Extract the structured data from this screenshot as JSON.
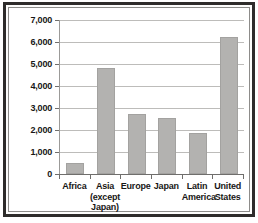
{
  "chart_data": {
    "type": "bar",
    "title": "",
    "subtitle": "",
    "xlabel": "",
    "ylabel": "",
    "categories": [
      "Africa",
      "Asia (except Japan)",
      "Europe",
      "Japan",
      "Latin America",
      "United States"
    ],
    "category_lines": [
      [
        "Africa"
      ],
      [
        "Asia",
        "(except",
        "Japan)"
      ],
      [
        "Europe"
      ],
      [
        "Japan"
      ],
      [
        "Latin",
        "America"
      ],
      [
        "United",
        "States"
      ]
    ],
    "values": [
      500,
      4800,
      2750,
      2550,
      1850,
      6250
    ],
    "ylim": [
      0,
      7000
    ],
    "ytick_values": [
      0,
      1000,
      2000,
      3000,
      4000,
      5000,
      6000,
      7000
    ],
    "ytick_labels": [
      "0",
      "1,000",
      "2,000",
      "3,000",
      "4,000",
      "5,000",
      "6,000",
      "7,000"
    ],
    "grid": true,
    "legend": "none",
    "bar_color": "#b3b2b0",
    "axis_color": "#6f6e6c",
    "grid_color": "#bdbcba",
    "text_color": "#181716",
    "frame_color": "#2e2c2b",
    "background_color": "#ffffff"
  }
}
